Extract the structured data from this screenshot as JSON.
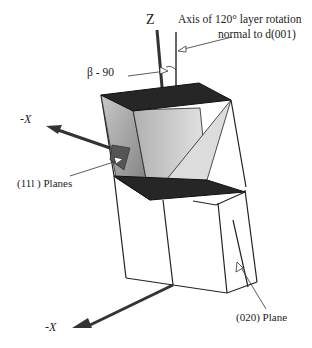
{
  "diagram": {
    "labels": {
      "z_axis": "Z",
      "rotation_axis": "Axis of 120° layer  rotation",
      "normal": "normal to d(001)",
      "beta": "β - 90",
      "neg_x_upper": "-X",
      "planes_11l": "(11l  ) Planes",
      "neg_x_lower": "-X",
      "plane_020": "(020)  Plane"
    },
    "colors": {
      "line": "#1e1e1e",
      "dark_face": "#262626",
      "mid_face": "#9a9a9a",
      "light_face": "#d6d6d6"
    }
  }
}
